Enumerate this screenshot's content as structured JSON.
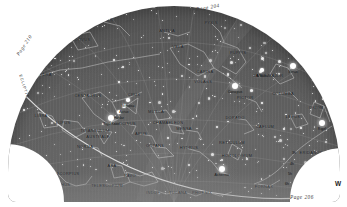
{
  "page": {
    "bg_color": "#ffffff",
    "sky_color": "#5d5d5d",
    "width": 347,
    "height": 207
  },
  "labels": {
    "page_top": "Page 204",
    "page_left": "Page 210",
    "page_bottom": "Page 206",
    "direction_west": "W",
    "ecliptic": "ECLIPTIC"
  },
  "hour_markers": [
    {
      "label": "3h",
      "x": 292,
      "y": 151
    },
    {
      "label": "4h",
      "x": 290,
      "y": 162
    },
    {
      "label": "5h",
      "x": 288,
      "y": 172
    },
    {
      "label": "6h",
      "x": 285,
      "y": 182
    }
  ],
  "constellations": [
    {
      "name": "CRATER",
      "x": 104,
      "y": 19
    },
    {
      "name": "CORVUS",
      "x": 81,
      "y": 39
    },
    {
      "name": "HYDRA",
      "x": 44,
      "y": 74
    },
    {
      "name": "ANTLIA",
      "x": 167,
      "y": 30
    },
    {
      "name": "PYXIS",
      "x": 211,
      "y": 22
    },
    {
      "name": "VELA",
      "x": 178,
      "y": 46
    },
    {
      "name": "PUPPIS",
      "x": 238,
      "y": 52
    },
    {
      "name": "CARINA",
      "x": 205,
      "y": 71
    },
    {
      "name": "VOLANS",
      "x": 203,
      "y": 81
    },
    {
      "name": "CANIS MAJOR",
      "x": 268,
      "y": 75
    },
    {
      "name": "COLUMBA",
      "x": 283,
      "y": 93
    },
    {
      "name": "LEPUS",
      "x": 293,
      "y": 116
    },
    {
      "name": "ORION",
      "x": 316,
      "y": 107
    },
    {
      "name": "PICTOR",
      "x": 245,
      "y": 97
    },
    {
      "name": "DORADO",
      "x": 235,
      "y": 117
    },
    {
      "name": "CAELUM",
      "x": 265,
      "y": 126
    },
    {
      "name": "MENSA",
      "x": 184,
      "y": 128
    },
    {
      "name": "RETICULUM",
      "x": 232,
      "y": 142
    },
    {
      "name": "HOROLOGIUM",
      "x": 237,
      "y": 155
    },
    {
      "name": "HYDRUS",
      "x": 189,
      "y": 147
    },
    {
      "name": "ERIDANUS",
      "x": 311,
      "y": 152
    },
    {
      "name": "FORNAX",
      "x": 264,
      "y": 186
    },
    {
      "name": "PHOENIX",
      "x": 202,
      "y": 192
    },
    {
      "name": "TUCANA",
      "x": 178,
      "y": 192
    },
    {
      "name": "INDUS",
      "x": 153,
      "y": 192
    },
    {
      "name": "PAVO",
      "x": 130,
      "y": 175
    },
    {
      "name": "OCTANS",
      "x": 155,
      "y": 145
    },
    {
      "name": "APUS",
      "x": 141,
      "y": 133
    },
    {
      "name": "CHAMAELEON",
      "x": 168,
      "y": 122
    },
    {
      "name": "MUSCA",
      "x": 156,
      "y": 111
    },
    {
      "name": "CRUX",
      "x": 134,
      "y": 94
    },
    {
      "name": "CENTAURUS",
      "x": 88,
      "y": 95
    },
    {
      "name": "CIRCINUS",
      "x": 125,
      "y": 123
    },
    {
      "name": "TRIANGULUM",
      "x": 95,
      "y": 130
    },
    {
      "name": "AUSTRALE",
      "x": 98,
      "y": 136
    },
    {
      "name": "NORMA",
      "x": 85,
      "y": 146
    },
    {
      "name": "ARA",
      "x": 112,
      "y": 165
    },
    {
      "name": "TELESCOPIUM",
      "x": 107,
      "y": 185
    },
    {
      "name": "LUPUS",
      "x": 63,
      "y": 122
    },
    {
      "name": "LIBRA",
      "x": 41,
      "y": 115
    },
    {
      "name": "SCORPIUS",
      "x": 68,
      "y": 173
    },
    {
      "name": "OPHIUCHUS",
      "x": 57,
      "y": 184
    }
  ],
  "named_stars": [
    {
      "name": "Sirius",
      "x": 293,
      "y": 66,
      "mag": 1
    },
    {
      "name": "Canopus",
      "x": 235,
      "y": 86,
      "mag": 1
    },
    {
      "name": "Rigel",
      "x": 322,
      "y": 123,
      "mag": 1
    },
    {
      "name": "Achernar",
      "x": 222,
      "y": 169,
      "mag": 1
    },
    {
      "name": "Adhara",
      "x": 262,
      "y": 70,
      "mag": 2
    },
    {
      "name": "Mimosa",
      "x": 128,
      "y": 100,
      "mag": 2
    },
    {
      "name": "Acrux",
      "x": 124,
      "y": 106,
      "mag": 2
    },
    {
      "name": "Rigil Kent",
      "x": 111,
      "y": 118,
      "mag": 1
    },
    {
      "name": "Hadar",
      "x": 119,
      "y": 112,
      "mag": 2
    },
    {
      "name": "Antares",
      "x": 50,
      "y": 173,
      "mag": 1
    }
  ]
}
